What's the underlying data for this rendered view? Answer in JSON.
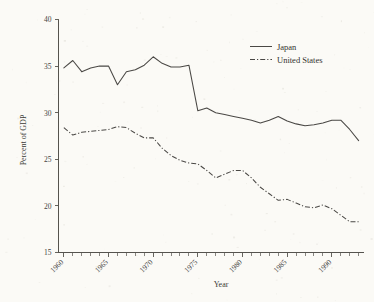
{
  "chart_data": {
    "type": "line",
    "title": "",
    "xlabel": "Year",
    "ylabel": "Percent of GDP",
    "xlim": [
      1959.4,
      1993.6
    ],
    "ylim": [
      15,
      40
    ],
    "grid": false,
    "legend_position": "top-right",
    "yticks": [
      15,
      20,
      25,
      30,
      35,
      40
    ],
    "ytick_labels": [
      "15",
      "20",
      "25",
      "30",
      "35",
      "40"
    ],
    "xticks": [
      1960,
      1965,
      1970,
      1975,
      1980,
      1985,
      1990
    ],
    "xtick_labels": [
      "1960",
      "1965",
      "1970",
      "1975",
      "1980",
      "1985",
      "1990"
    ],
    "xticks_minor": [
      1961,
      1962,
      1963,
      1964,
      1966,
      1967,
      1968,
      1969,
      1971,
      1972,
      1973,
      1974,
      1976,
      1977,
      1978,
      1979,
      1981,
      1982,
      1983,
      1984,
      1986,
      1987,
      1988,
      1989,
      1991,
      1992,
      1993
    ],
    "x": [
      1960,
      1961,
      1962,
      1963,
      1964,
      1965,
      1966,
      1967,
      1968,
      1969,
      1970,
      1971,
      1972,
      1973,
      1974,
      1975,
      1976,
      1977,
      1978,
      1979,
      1980,
      1981,
      1982,
      1983,
      1984,
      1985,
      1986,
      1987,
      1988,
      1989,
      1990,
      1991,
      1992,
      1993
    ],
    "series": [
      {
        "name": "Japan",
        "style": "solid",
        "color": "#4a4845",
        "values": [
          34.8,
          35.6,
          34.4,
          34.8,
          35.0,
          35.0,
          33.0,
          34.4,
          34.6,
          35.1,
          36.0,
          35.3,
          34.9,
          34.9,
          35.1,
          30.2,
          30.5,
          30.0,
          29.8,
          29.6,
          29.4,
          29.2,
          28.9,
          29.2,
          29.6,
          29.1,
          28.8,
          28.6,
          28.7,
          28.9,
          29.2,
          29.2,
          28.2,
          27.0
        ]
      },
      {
        "name": "United States",
        "style": "dash-dot",
        "color": "#4a4845",
        "values": [
          28.4,
          27.6,
          27.9,
          28.0,
          28.1,
          28.2,
          28.5,
          28.4,
          27.8,
          27.3,
          27.3,
          26.2,
          25.4,
          24.9,
          24.6,
          24.5,
          23.8,
          23.0,
          23.4,
          23.8,
          23.8,
          23.0,
          22.0,
          21.3,
          20.6,
          20.7,
          20.3,
          19.9,
          19.8,
          20.1,
          19.7,
          19.0,
          18.3,
          18.3
        ]
      }
    ]
  },
  "legend": {
    "items": [
      {
        "label": "Japan",
        "style": "solid"
      },
      {
        "label": "United States",
        "style": "dash-dot"
      }
    ]
  },
  "axis": {
    "x_title": "Year",
    "y_title": "Percent of GDP"
  }
}
